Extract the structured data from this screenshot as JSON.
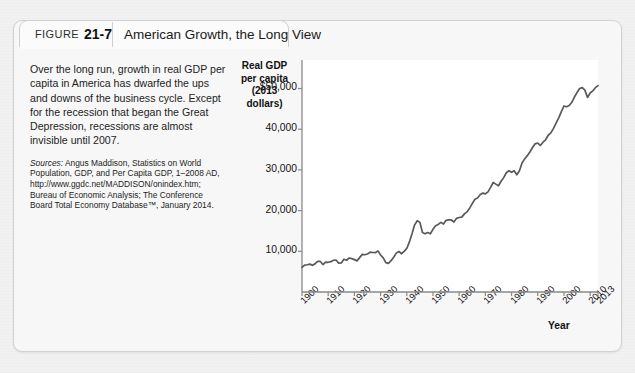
{
  "figure": {
    "label_word": "Figure",
    "number": "21-7",
    "title": "American Growth, the Long View"
  },
  "caption": {
    "body": "Over the long run, growth in real GDP per capita in America has dwarfed the ups and downs of the business cycle. Except for the recession that began the Great Depression, recessions are almost invisible until 2007.",
    "sources_prefix": "Sources:",
    "sources_body": " Angus Maddison, Statistics on World Population, GDP, and Per Capita GDP, 1–2008 AD, http://www.ggdc.net/MADDISON/onindex.htm; Bureau of Economic Analysis; The Conference Board Total Economy Database™, January 2014."
  },
  "chart_data": {
    "type": "line",
    "title": "American Growth, the Long View",
    "ylabel": "Real GDP per capita (2013 dollars)",
    "ylabel_lines": [
      "Real GDP",
      "per capita",
      "(2013 dollars)"
    ],
    "xlabel": "Year",
    "ylim": [
      0,
      57000
    ],
    "xlim": [
      1900,
      2013
    ],
    "grid": false,
    "legend": null,
    "line_color": "#595959",
    "ytick_labels": [
      "$50,000",
      "40,000",
      "30,000",
      "20,000",
      "10,000"
    ],
    "ytick_values": [
      50000,
      40000,
      30000,
      20000,
      10000
    ],
    "xtick_labels": [
      "1900",
      "1910",
      "1920",
      "1930",
      "1940",
      "1950",
      "1960",
      "1970",
      "1980",
      "1990",
      "2000",
      "2010",
      "2013"
    ],
    "xtick_values": [
      1900,
      1910,
      1920,
      1930,
      1940,
      1950,
      1960,
      1970,
      1980,
      1990,
      2000,
      2010,
      2013
    ],
    "x": [
      1900,
      1901,
      1902,
      1903,
      1904,
      1905,
      1906,
      1907,
      1908,
      1909,
      1910,
      1911,
      1912,
      1913,
      1914,
      1915,
      1916,
      1917,
      1918,
      1919,
      1920,
      1921,
      1922,
      1923,
      1924,
      1925,
      1926,
      1927,
      1928,
      1929,
      1930,
      1931,
      1932,
      1933,
      1934,
      1935,
      1936,
      1937,
      1938,
      1939,
      1940,
      1941,
      1942,
      1943,
      1944,
      1945,
      1946,
      1947,
      1948,
      1949,
      1950,
      1951,
      1952,
      1953,
      1954,
      1955,
      1956,
      1957,
      1958,
      1959,
      1960,
      1961,
      1962,
      1963,
      1964,
      1965,
      1966,
      1967,
      1968,
      1969,
      1970,
      1971,
      1972,
      1973,
      1974,
      1975,
      1976,
      1977,
      1978,
      1979,
      1980,
      1981,
      1982,
      1983,
      1984,
      1985,
      1986,
      1987,
      1988,
      1989,
      1990,
      1991,
      1992,
      1993,
      1994,
      1995,
      1996,
      1997,
      1998,
      1999,
      2000,
      2001,
      2002,
      2003,
      2004,
      2005,
      2006,
      2007,
      2008,
      2009,
      2010,
      2011,
      2012,
      2013
    ],
    "y": [
      6050,
      6600,
      6700,
      6850,
      6550,
      6950,
      7550,
      7500,
      6750,
      7350,
      7300,
      7450,
      7800,
      7850,
      7100,
      7150,
      8050,
      7800,
      8350,
      8200,
      7950,
      7650,
      8450,
      9250,
      9150,
      9350,
      9800,
      9700,
      9650,
      10100,
      9100,
      8400,
      7200,
      7050,
      7700,
      8550,
      9550,
      9950,
      9400,
      10000,
      10700,
      12300,
      14300,
      16500,
      17500,
      17100,
      14600,
      14300,
      14600,
      14300,
      15400,
      16300,
      16600,
      17100,
      16700,
      17600,
      17700,
      17700,
      17200,
      18100,
      18300,
      18400,
      19200,
      19700,
      20600,
      21700,
      22800,
      23100,
      23900,
      24300,
      24100,
      24600,
      25700,
      26900,
      26500,
      26100,
      27200,
      28100,
      29300,
      29800,
      29400,
      29800,
      28800,
      29800,
      31700,
      32700,
      33500,
      34400,
      35500,
      36400,
      36600,
      36000,
      36800,
      37400,
      38500,
      39100,
      40200,
      41500,
      42800,
      44300,
      45700,
      45500,
      45800,
      46600,
      47900,
      49000,
      50000,
      50200,
      49600,
      47800,
      48900,
      49400,
      50200,
      50700
    ]
  }
}
